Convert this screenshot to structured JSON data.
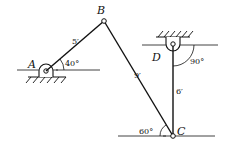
{
  "diagram": {
    "type": "four-bar linkage",
    "colors": {
      "ink": "#111111",
      "background": "#ffffff"
    },
    "points": {
      "A": {
        "label": "A",
        "x": 46,
        "y": 70
      },
      "B": {
        "label": "B",
        "x": 104,
        "y": 21
      },
      "C": {
        "label": "C",
        "x": 173,
        "y": 136
      },
      "D": {
        "label": "D",
        "x": 173,
        "y": 45
      }
    },
    "links": [
      {
        "id": "AB",
        "length_label": "5′"
      },
      {
        "id": "BC",
        "length_label": "9′"
      },
      {
        "id": "CD",
        "length_label": "6′"
      }
    ],
    "angles": {
      "A": "40°",
      "D": "90°",
      "C": "60°"
    }
  }
}
